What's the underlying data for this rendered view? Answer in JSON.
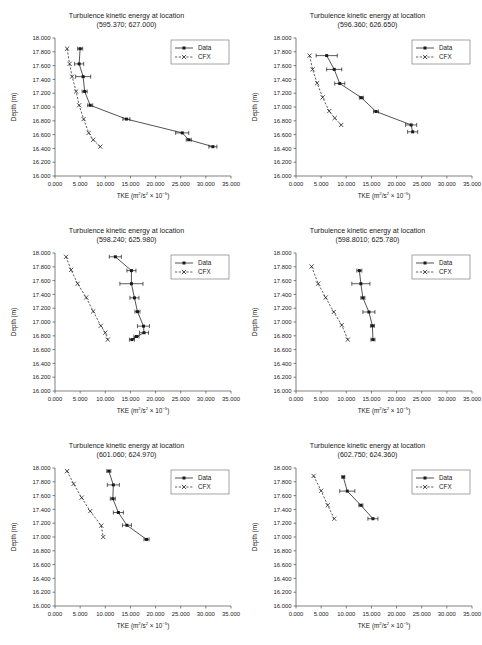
{
  "figure": {
    "name": "Turbulence kinetic energy profiles",
    "panel_count": 6,
    "columns": 2,
    "rows": 3
  },
  "common": {
    "title_line1": "Turbulence kinetic energy at location",
    "xlabel_main": "TKE (m",
    "xlabel_full": "TKE (m²/s² × 10⁻⁵)",
    "ylabel": "Depth (m)",
    "xticks": [
      "0.000",
      "5.000",
      "10.000",
      "15.000",
      "20.000",
      "25.000",
      "30.000",
      "35.000"
    ],
    "yticks": [
      "18.000",
      "17.800",
      "17.600",
      "17.400",
      "17.200",
      "17.000",
      "16.800",
      "16.600",
      "16.400",
      "16.200",
      "16.000"
    ],
    "xlim": [
      0,
      35
    ],
    "ylim": [
      16.0,
      18.0
    ],
    "legend": {
      "data_label": "Data",
      "cfx_label": "CFX",
      "data_style": "solid-line-square-marker",
      "cfx_style": "dashed-line-x-marker",
      "position": "top-right"
    },
    "colors": {
      "line": "#1a1a1a",
      "axis": "#4a4a4a",
      "background": "#ffffff"
    }
  },
  "chart_data": [
    {
      "type": "line",
      "panel": 1,
      "title": "Turbulence kinetic energy at location",
      "subtitle": "(595.370; 627.000)",
      "xlabel": "TKE (m²/s² × 10⁻⁵)",
      "ylabel": "Depth (m)",
      "xlim": [
        0,
        35
      ],
      "ylim": [
        16.0,
        18.0
      ],
      "grid": false,
      "series": [
        {
          "name": "Data",
          "x": [
            5.0,
            4.8,
            5.6,
            5.9,
            7.0,
            14.2,
            25.3,
            26.6,
            31.4
          ],
          "y": [
            17.845,
            17.625,
            17.44,
            17.225,
            17.025,
            16.825,
            16.625,
            16.525,
            16.425
          ],
          "xerr": [
            0.5,
            0.9,
            1.5,
            0.5,
            0.5,
            0.7,
            1.3,
            0.5,
            0.8
          ]
        },
        {
          "name": "CFX",
          "x": [
            2.4,
            2.9,
            3.4,
            4.2,
            4.8,
            5.7,
            6.7,
            7.6,
            9.0
          ],
          "y": [
            17.845,
            17.625,
            17.44,
            17.225,
            17.025,
            16.825,
            16.625,
            16.525,
            16.425
          ],
          "xerr": null
        }
      ]
    },
    {
      "type": "line",
      "panel": 2,
      "title": "Turbulence kinetic energy at location",
      "subtitle": "(596.360; 626.650)",
      "xlabel": "TKE (m²/s² × 10⁻⁵)",
      "ylabel": "Depth (m)",
      "xlim": [
        0,
        35
      ],
      "ylim": [
        16.0,
        18.0
      ],
      "grid": false,
      "series": [
        {
          "name": "Data",
          "x": [
            6.1,
            7.6,
            8.7,
            13.0,
            15.9,
            22.9,
            23.2
          ],
          "y": [
            17.745,
            17.545,
            17.34,
            17.135,
            16.935,
            16.74,
            16.64
          ],
          "xerr": [
            2.1,
            1.5,
            1.0,
            0.4,
            0.5,
            1.1,
            1.0
          ]
        },
        {
          "name": "CFX",
          "x": [
            2.7,
            3.3,
            4.2,
            5.3,
            6.6,
            7.7,
            9.0
          ],
          "y": [
            17.745,
            17.545,
            17.345,
            17.14,
            16.94,
            16.84,
            16.74
          ]
        }
      ]
    },
    {
      "type": "line",
      "panel": 3,
      "title": "Turbulence kinetic energy at location",
      "subtitle": "(598.240; 625.980)",
      "xlabel": "TKE (m²/s² × 10⁻⁵)",
      "ylabel": "Depth (m)",
      "xlim": [
        0,
        35
      ],
      "ylim": [
        16.0,
        18.0
      ],
      "grid": false,
      "series": [
        {
          "name": "Data",
          "x": [
            12.0,
            15.2,
            15.2,
            15.8,
            16.4,
            17.6,
            17.7,
            15.3,
            16.2
          ],
          "y": [
            17.945,
            17.745,
            17.555,
            17.35,
            17.15,
            16.94,
            16.845,
            16.745,
            16.79
          ],
          "xerr": [
            1.2,
            0.9,
            2.3,
            0.9,
            0.5,
            1.2,
            0.9,
            0.5,
            0.5
          ]
        },
        {
          "name": "CFX",
          "x": [
            2.2,
            3.2,
            4.5,
            6.2,
            7.6,
            9.1,
            10.0,
            10.5
          ],
          "y": [
            17.945,
            17.755,
            17.555,
            17.355,
            17.155,
            16.945,
            16.845,
            16.745
          ]
        }
      ]
    },
    {
      "type": "line",
      "panel": 4,
      "title": "Turbulence kinetic energy at location",
      "subtitle": "(598.8010; 625.780)",
      "xlabel": "TKE (m²/s² × 10⁻⁵)",
      "ylabel": "Depth (m)",
      "xlim": [
        0,
        35
      ],
      "ylim": [
        16.0,
        18.0
      ],
      "grid": false,
      "series": [
        {
          "name": "Data",
          "x": [
            12.6,
            12.9,
            13.3,
            14.5,
            15.2,
            15.3
          ],
          "y": [
            17.745,
            17.555,
            17.35,
            17.145,
            16.945,
            16.745
          ],
          "xerr": [
            0.5,
            1.8,
            0.4,
            1.2,
            0.4,
            0.4
          ]
        },
        {
          "name": "CFX",
          "x": [
            3.1,
            4.4,
            5.9,
            7.5,
            9.1,
            10.3
          ],
          "y": [
            17.805,
            17.555,
            17.355,
            17.145,
            16.955,
            16.745
          ]
        }
      ]
    },
    {
      "type": "line",
      "panel": 5,
      "title": "Turbulence kinetic energy at location",
      "subtitle": "(601.060; 624.970)",
      "xlabel": "TKE (m²/s² × 10⁻⁵)",
      "ylabel": "Depth (m)",
      "xlim": [
        0,
        35
      ],
      "ylim": [
        16.0,
        18.0
      ],
      "grid": false,
      "series": [
        {
          "name": "Data",
          "x": [
            10.7,
            11.6,
            11.5,
            12.6,
            14.3,
            18.2
          ],
          "y": [
            17.955,
            17.755,
            17.555,
            17.355,
            17.17,
            16.965
          ],
          "xerr": [
            0.4,
            1.2,
            0.5,
            1.0,
            0.9,
            0.5
          ]
        },
        {
          "name": "CFX",
          "x": [
            2.4,
            3.7,
            5.3,
            7.0,
            9.2,
            9.6
          ],
          "y": [
            17.955,
            17.77,
            17.57,
            17.375,
            17.165,
            17.0
          ]
        }
      ]
    },
    {
      "type": "line",
      "panel": 6,
      "title": "Turbulence kinetic energy at location",
      "subtitle": "(602.750; 624.360)",
      "xlabel": "TKE (m²/s² × 10⁻⁵)",
      "ylabel": "Depth (m)",
      "xlim": [
        0,
        35
      ],
      "ylim": [
        16.0,
        18.0
      ],
      "grid": false,
      "series": [
        {
          "name": "Data",
          "x": [
            9.4,
            10.2,
            12.9,
            15.3
          ],
          "y": [
            17.87,
            17.665,
            17.46,
            17.265
          ],
          "xerr": [
            0.3,
            1.5,
            0.4,
            1.0
          ]
        },
        {
          "name": "CFX",
          "x": [
            3.5,
            5.0,
            6.3,
            7.6
          ],
          "y": [
            17.885,
            17.67,
            17.46,
            17.265
          ]
        }
      ]
    }
  ]
}
